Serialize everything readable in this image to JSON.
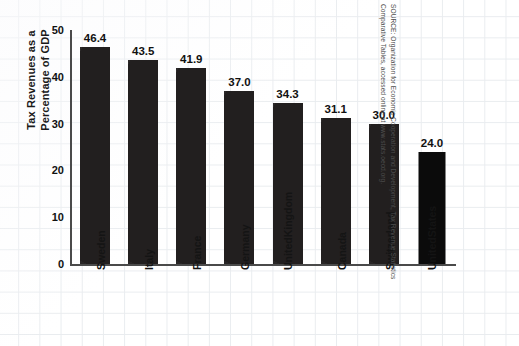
{
  "chart_data": {
    "type": "bar",
    "title": "",
    "xlabel": "",
    "ylabel": "Tax Revenues as a Percentage of GDP",
    "ylabel_lines": [
      "Tax Revenues as a",
      "Percentage of GDP"
    ],
    "ylim": [
      0,
      50
    ],
    "yticks": [
      0,
      10,
      20,
      30,
      40,
      50
    ],
    "ytick_labels": [
      "0",
      "10",
      "20",
      "30",
      "40",
      "50"
    ],
    "grid": true,
    "legend": null,
    "bar_color": "#221f1f",
    "categories": [
      "Sweden",
      "Italy",
      "France",
      "Germany",
      "United Kingdom",
      "Canada",
      "Switzerland",
      "United States"
    ],
    "category_label_lines": [
      [
        "Sweden"
      ],
      [
        "Italy"
      ],
      [
        "France"
      ],
      [
        "Germany"
      ],
      [
        "United",
        "Kingdom"
      ],
      [
        "Canada"
      ],
      [
        "Switzerland"
      ],
      [
        "United",
        "States"
      ]
    ],
    "values": [
      46.4,
      43.5,
      41.9,
      37.0,
      34.3,
      31.1,
      30.0,
      24.0
    ],
    "value_labels": [
      "46.4",
      "43.5",
      "41.9",
      "37.0",
      "34.3",
      "31.1",
      "30.0",
      "24.0"
    ]
  },
  "source": {
    "line1": "SOURCE: Organization for Economic Cooperation and Development, Tax Revenue Statistics",
    "line2": "Comparative Tables, accessed online at www.stats.oecd.org."
  }
}
